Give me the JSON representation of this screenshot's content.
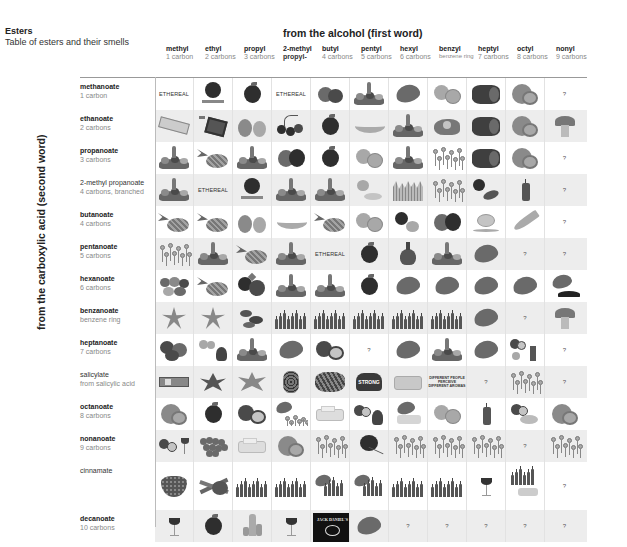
{
  "header": {
    "title": "Esters",
    "subtitle": "Table of esters and their smells",
    "column_axis_label": "from the alcohol (first word)",
    "row_axis_label": "from the carboxylic acid (second word)"
  },
  "columns": [
    {
      "name": "methyl",
      "detail": "1 carbon"
    },
    {
      "name": "ethyl",
      "detail": "2 carbons"
    },
    {
      "name": "propyl",
      "detail": "3 carbons"
    },
    {
      "name": "2-methyl",
      "detail": "propyl-"
    },
    {
      "name": "butyl",
      "detail": "4 carbons"
    },
    {
      "name": "pentyl",
      "detail": "5 carbons"
    },
    {
      "name": "hexyl",
      "detail": "6 carbons"
    },
    {
      "name": "benzyl",
      "detail": "benzene ring"
    },
    {
      "name": "heptyl",
      "detail": "7 carbons"
    },
    {
      "name": "octyl",
      "detail": "8 carbons"
    },
    {
      "name": "nonyl",
      "detail": "9 carbons"
    }
  ],
  "rows": [
    {
      "name": "methanoate",
      "detail": "1 carbon",
      "cells": [
        "ETHEREAL",
        "rum-bacardi",
        "apple",
        "ETHEREAL",
        "raspberry",
        "fruit-salad",
        "leaf",
        "peach",
        "melon",
        "orange",
        "?"
      ]
    },
    {
      "name": "ethanoate",
      "detail": "2 carbons",
      "cells": [
        "nail-polish",
        "glue",
        "pear",
        "cherries",
        "apple",
        "banana",
        "fruit-salad",
        "flower",
        "melon",
        "orange",
        "mushroom"
      ]
    },
    {
      "name": "propanoate",
      "detail": "3 carbons",
      "cells": [
        "fruit-salad",
        "pineapple",
        "fruit-salad",
        "plum",
        "apple",
        "peach",
        "fruit-salad",
        "flowers",
        "melon",
        "orange",
        "?"
      ]
    },
    {
      "name": "2-methyl propanoate",
      "detail": "4 carbons, branched",
      "cells": [
        "fruit-salad",
        "ETHEREAL",
        "rum-bacardi",
        "fruit-salad",
        "fruit-salad",
        "peach-cream",
        "grass",
        "flowers",
        "apple-date",
        "candle",
        "?"
      ]
    },
    {
      "name": "butanoate",
      "detail": "4 carbons",
      "cells": [
        "pineapple",
        "pineapple",
        "pear",
        "banana",
        "pineapple",
        "peach",
        "apple-pear",
        "plum",
        "tea",
        "parsnip",
        "?"
      ]
    },
    {
      "name": "pentanoate",
      "detail": "5 carbons",
      "cells": [
        "flowers",
        "fruit-salad",
        "pineapple",
        "fruit-salad",
        "ETHEREAL",
        "apple",
        "brandy",
        "fruit-salad",
        "leaf",
        "?",
        "?"
      ]
    },
    {
      "name": "hexanoate",
      "detail": "6 carbons",
      "cells": [
        "fruits-mix",
        "pineapple",
        "blackberries",
        "fruit-salad",
        "fruit-salad",
        "apple",
        "leaf",
        "leaf",
        "leaf",
        "leaf",
        "leaf-earth"
      ]
    },
    {
      "name": "benzanoate",
      "detail": "benzene ring",
      "cells": [
        "lily",
        "lily",
        "dates",
        "bottles",
        "bottles",
        "bottles",
        "bottles",
        "bottles",
        "leaf",
        "?",
        "mushroom"
      ]
    },
    {
      "name": "heptanoate",
      "detail": "7 carbons",
      "cells": [
        "raspberries",
        "apricot-brandy",
        "fruit-salad",
        "leaf",
        "coconut",
        "?",
        "leaf",
        "fruit-salad",
        "leaf",
        "coconut-smiley-candle",
        "?"
      ]
    },
    {
      "name": "salicylate",
      "detail": "from salicylic acid",
      "cells": [
        "gum-pack",
        "wintergreen",
        "mint",
        "dried-herbs",
        "herbs",
        "STRONG",
        "soap",
        "flowers",
        "DIFFERENT PEOPLE PERCEIVE DIFFERENT AROMAS",
        "?",
        "flowers",
        "?"
      ]
    },
    {
      "name": "octanoate",
      "detail": "8 carbons",
      "cells": [
        "orange",
        "apple",
        "coconut",
        "leaf-flowers",
        "butter",
        "coconut-brandy",
        "leaf-butter",
        "peach",
        "candle",
        "coconut-honey",
        "orange"
      ]
    },
    {
      "name": "nonanoate",
      "detail": "9 carbons",
      "cells": [
        "coconut-wine",
        "grapes",
        "butter",
        "orange",
        "flowers",
        "rose",
        "flowers",
        "flowers",
        "flowers",
        "?",
        "flowers"
      ]
    },
    {
      "name": "cinnamate",
      "detail": "",
      "cells": [
        "strawberry",
        "cinnamon",
        "bottles",
        "bottles",
        "leaf-bottles",
        "leaf-bottles",
        "bottles",
        "bottles",
        "wine",
        "bottles-butter",
        "?"
      ]
    },
    {
      "name": "decanoate",
      "detail": "10 carbons",
      "cells": [
        "wine",
        "apple",
        "oil-bottles",
        "wine",
        "jack-daniels",
        "leaf",
        "?",
        "?",
        "?",
        "?",
        "?"
      ]
    }
  ]
}
